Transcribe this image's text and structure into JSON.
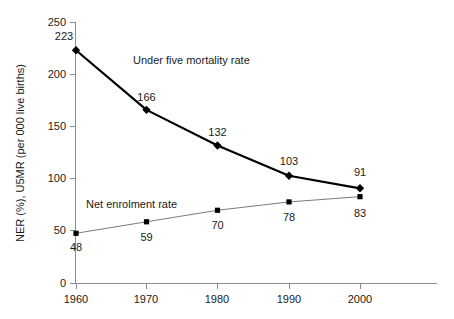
{
  "chart_data": {
    "type": "line",
    "title": "",
    "xlabel": "",
    "ylabel": "NER (%), U5MR (per 000 live births)",
    "categories": [
      "1960",
      "1970",
      "1980",
      "1990",
      "2000"
    ],
    "x": [
      1960,
      1970,
      1980,
      1990,
      2000
    ],
    "xlim": [
      1955,
      2005
    ],
    "ylim": [
      0,
      250
    ],
    "yticks": [
      "0",
      "50",
      "100",
      "150",
      "200",
      "250"
    ],
    "ytick_values": [
      0,
      50,
      100,
      150,
      200,
      250
    ],
    "grid": false,
    "legend_position": "inline-annotation",
    "series": [
      {
        "name": "Under five mortality rate",
        "key": "u5mr",
        "values": [
          223,
          166,
          132,
          103,
          91
        ],
        "labels": [
          "223",
          "166",
          "132",
          "103",
          "91"
        ],
        "color": "#000000",
        "marker": "diamond",
        "line_width": 2.2
      },
      {
        "name": "Net enrolment rate",
        "key": "ner",
        "values": [
          48,
          59,
          70,
          78,
          83
        ],
        "labels": [
          "48",
          "59",
          "70",
          "78",
          "83"
        ],
        "color": "#7a7a7a",
        "marker": "square",
        "line_width": 1
      }
    ],
    "annotations": [
      {
        "text": "Under five mortality rate",
        "x": 133,
        "y": 64
      },
      {
        "text": "Net enrolment rate",
        "x": 86,
        "y": 208
      }
    ]
  }
}
